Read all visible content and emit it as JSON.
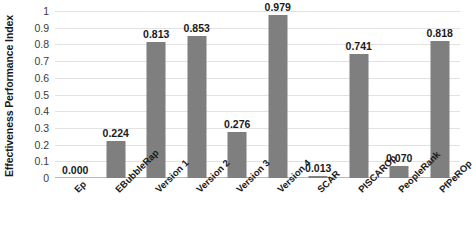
{
  "chart_data": {
    "type": "bar",
    "title": "",
    "xlabel": "",
    "ylabel": "Effectiveness Performance Index",
    "ylim": [
      0,
      1
    ],
    "grid": true,
    "legend": "none",
    "categories": [
      "Ep",
      "EBubbleRap",
      "Version 1",
      "Version 2",
      "Version 3",
      "Version 4",
      "SCAR",
      "PISCAROp",
      "PeopleRank",
      "PfPeROp"
    ],
    "values": [
      0.0,
      0.224,
      0.813,
      0.853,
      0.276,
      0.979,
      0.013,
      0.741,
      0.07,
      0.818
    ],
    "value_labels": [
      "0.000",
      "0.224",
      "0.813",
      "0.853",
      "0.276",
      "0.979",
      "0.013",
      "0.741",
      "0.070",
      "0.818"
    ],
    "y_ticks": [
      0,
      0.1,
      0.2,
      0.3,
      0.4,
      0.5,
      0.6,
      0.7,
      0.8,
      0.9,
      1
    ],
    "y_tick_labels": [
      "0",
      "0.1",
      "0.2",
      "0.3",
      "0.4",
      "0.5",
      "0.6",
      "0.7",
      "0.8",
      "0.9",
      "1"
    ],
    "bar_color": "#7f7f7f",
    "gridline_color": "#e2e2e2",
    "background_color": "#ffffff"
  }
}
